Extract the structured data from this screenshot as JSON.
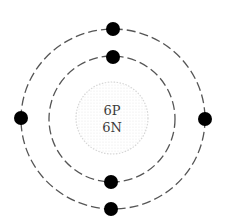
{
  "diagram": {
    "type": "bohr-atom-model",
    "element_hint": "carbon",
    "nucleus": {
      "protons_label": "6P",
      "neutrons_label": "6N",
      "center": [
        112,
        118
      ],
      "radius": 36,
      "style": "stippled"
    },
    "shells": [
      {
        "name": "inner",
        "radius": 64,
        "electron_count": 2
      },
      {
        "name": "outer",
        "radius": 92,
        "electron_count": 4
      }
    ],
    "electrons": [
      {
        "shell": "outer",
        "position": "top",
        "cx": 113,
        "cy": 29
      },
      {
        "shell": "inner",
        "position": "top",
        "cx": 113,
        "cy": 57
      },
      {
        "shell": "outer",
        "position": "left",
        "cx": 21,
        "cy": 118
      },
      {
        "shell": "outer",
        "position": "right",
        "cx": 205,
        "cy": 119
      },
      {
        "shell": "inner",
        "position": "bottom",
        "cx": 111,
        "cy": 182
      },
      {
        "shell": "outer",
        "position": "bottom",
        "cx": 111,
        "cy": 209
      }
    ],
    "colors": {
      "orbit": "#555555",
      "electron": "#000000",
      "nucleus_dots": "#c8c8c8",
      "text": "#3a3a3a",
      "background": "#ffffff"
    }
  }
}
